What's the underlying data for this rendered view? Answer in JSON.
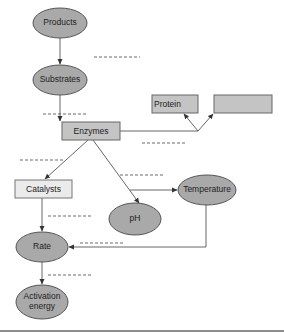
{
  "diagram": {
    "type": "concept-map",
    "nodes": [
      {
        "id": "products",
        "label": "Products",
        "shape": "ellipse"
      },
      {
        "id": "substrates",
        "label": "Substrates",
        "shape": "ellipse"
      },
      {
        "id": "protein",
        "label": "Protein",
        "shape": "box"
      },
      {
        "id": "blank_box",
        "label": "",
        "shape": "box"
      },
      {
        "id": "enzymes",
        "label": "Enzymes",
        "shape": "box"
      },
      {
        "id": "catalysts",
        "label": "Catalysts",
        "shape": "box"
      },
      {
        "id": "temperature",
        "label": "Temperature",
        "shape": "ellipse"
      },
      {
        "id": "ph",
        "label": "pH",
        "shape": "ellipse"
      },
      {
        "id": "rate",
        "label": "Rate",
        "shape": "ellipse"
      },
      {
        "id": "activation",
        "label_line1": "Activation",
        "label_line2": "energy",
        "shape": "ellipse"
      }
    ],
    "edges": [
      {
        "from": "products",
        "to": "substrates",
        "label": "________"
      },
      {
        "from": "substrates",
        "to": "enzymes",
        "label": "________"
      },
      {
        "from": "enzymes",
        "to": "protein",
        "label": "________"
      },
      {
        "from": "enzymes",
        "to": "blank_box",
        "label": "________"
      },
      {
        "from": "enzymes",
        "to": "catalysts",
        "label": "________"
      },
      {
        "from": "enzymes",
        "to": "ph",
        "label": "________"
      },
      {
        "from": "enzymes",
        "to": "temperature",
        "label": "________"
      },
      {
        "from": "catalysts",
        "to": "rate",
        "label": "________"
      },
      {
        "from": "temperature",
        "to": "rate",
        "label": "________"
      },
      {
        "from": "rate",
        "to": "activation",
        "label": "________"
      }
    ]
  },
  "labels": {
    "products": "Products",
    "substrates": "Substrates",
    "protein": "Protein",
    "blank_box": "",
    "enzymes": "Enzymes",
    "catalysts": "Catalysts",
    "temperature": "Temperature",
    "ph": "pH",
    "rate": "Rate",
    "activation_1": "Activation",
    "activation_2": "energy"
  }
}
